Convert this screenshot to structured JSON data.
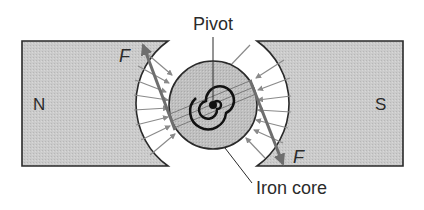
{
  "diagram": {
    "labels": {
      "north": "N",
      "south": "S",
      "pivot": "Pivot",
      "iron_core": "Iron core",
      "force_top": "F",
      "force_bottom": "F"
    },
    "colors": {
      "magnet_fill": "#c8c8c8",
      "core_fill": "#bdbdbd",
      "outline": "#2a2a2a",
      "field_arrow": "#8a8a8a",
      "force_arrow": "#6e6e6e",
      "background": "#ffffff"
    }
  }
}
